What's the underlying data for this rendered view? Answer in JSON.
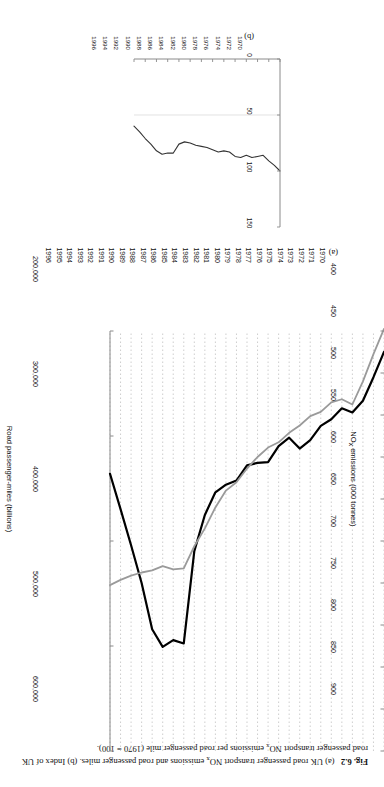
{
  "figure": {
    "number": "Fig. 6.2",
    "caption_a": "(a) UK road passenger transport NO",
    "caption_a_sub": "x",
    "caption_a_rest": " emissions and road passenger miles.",
    "caption_b": "(b) Index of UK road passenger transport NO",
    "caption_b_sub": "x",
    "caption_b_rest": " emissions per road passenger mile (1970 = 100).",
    "panel_a_id": "(a)",
    "panel_b_id": "(b)"
  },
  "colors": {
    "emissions_line": "#000000",
    "passenger_miles_line": "#9a9a9a",
    "axis": "#8a8a8a",
    "gridline": "#b9b9b9",
    "text": "#111111",
    "background": "#ffffff"
  },
  "chart_data": [
    {
      "id": "panel-a",
      "type": "line",
      "title": "",
      "panel_label": "(a)",
      "xlabel": "",
      "ylabel": "NOx emissions (000 tonnes)",
      "ylabel_display": "NO",
      "ylabel_sub": "x",
      "ylabel_rest": " emissions (000 tonnes)",
      "y2label": "Road passenger-miles (billions)",
      "grid": true,
      "legend": "none",
      "x": [
        1970,
        1971,
        1972,
        1973,
        1974,
        1975,
        1976,
        1977,
        1978,
        1979,
        1980,
        1981,
        1982,
        1983,
        1984,
        1985,
        1986,
        1987,
        1988,
        1989,
        1990,
        1991,
        1992,
        1993,
        1994,
        1995,
        1996
      ],
      "xticklabels": [
        "1970",
        "1971",
        "1972",
        "1973",
        "1974",
        "1975",
        "1976",
        "1977",
        "1978",
        "1979",
        "1980",
        "1981",
        "1982",
        "1983",
        "1984",
        "1985",
        "1986",
        "1987",
        "1988",
        "1989",
        "1990",
        "1991",
        "1992",
        "1993",
        "1994",
        "1995",
        "1996"
      ],
      "ylim": [
        400,
        900
      ],
      "yticks": [
        400,
        450,
        500,
        550,
        600,
        650,
        700,
        750,
        800,
        850,
        900
      ],
      "yticklabels": [
        "400",
        "450",
        "500",
        "550",
        "600",
        "650",
        "700",
        "750",
        "800",
        "850",
        "900"
      ],
      "y2lim": [
        200000,
        600000
      ],
      "y2ticks": [
        200000,
        300000,
        400000,
        500000,
        600000
      ],
      "y2ticklabels": [
        "200,000",
        "300,000",
        "400,000",
        "500,000",
        "600,000"
      ],
      "series": [
        {
          "name": "NOx emissions (000 tonnes)",
          "axis": "left",
          "color": "#000000",
          "width": 2.2,
          "values": [
            425,
            455,
            483,
            497,
            492,
            505,
            513,
            530,
            540,
            527,
            537,
            556,
            557,
            560,
            578,
            583,
            592,
            619,
            662,
            772,
            768,
            776,
            755,
            700,
            655,
            612,
            570
          ]
        },
        {
          "name": "Road passenger-miles (billions)",
          "axis": "right",
          "color": "#9a9a9a",
          "width": 1.8,
          "values": [
            198000,
            222000,
            248000,
            270000,
            265000,
            268000,
            277000,
            281000,
            290000,
            297000,
            306000,
            311000,
            320000,
            331000,
            344000,
            352000,
            368000,
            388000,
            405000,
            426000,
            427000,
            424000,
            428000,
            430000,
            433000,
            437000,
            442000
          ]
        }
      ]
    },
    {
      "id": "panel-b",
      "type": "line",
      "title": "",
      "panel_label": "(b)",
      "xlabel": "",
      "ylabel": "",
      "grid": false,
      "legend": "none",
      "x": [
        1970,
        1971,
        1972,
        1973,
        1974,
        1975,
        1976,
        1977,
        1978,
        1979,
        1980,
        1981,
        1982,
        1983,
        1984,
        1985,
        1986,
        1987,
        1988,
        1989,
        1990,
        1991,
        1992,
        1993,
        1994,
        1995,
        1996
      ],
      "xticks": [
        1970,
        1972,
        1974,
        1976,
        1978,
        1980,
        1982,
        1984,
        1986,
        1988,
        1990,
        1992,
        1994,
        1996
      ],
      "xticklabels": [
        "1970",
        "1972",
        "1974",
        "1976",
        "1978",
        "1980",
        "1982",
        "1984",
        "1986",
        "1988",
        "1990",
        "1992",
        "1994",
        "1996"
      ],
      "ylim": [
        0,
        150
      ],
      "yticks": [
        0,
        50,
        100,
        150
      ],
      "yticklabels": [
        "0",
        "50",
        "100",
        "150"
      ],
      "series": [
        {
          "name": "Index (1970 = 100)",
          "color": "#333333",
          "width": 1.1,
          "values": [
            100,
            95,
            91,
            86,
            87,
            88,
            86,
            88,
            87,
            83,
            82,
            83,
            81,
            79,
            78,
            77,
            75,
            74,
            76,
            84,
            84,
            85,
            82,
            76,
            71,
            65,
            60
          ]
        }
      ]
    }
  ]
}
